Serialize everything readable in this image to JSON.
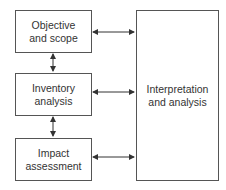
{
  "diagram": {
    "boxes": [
      {
        "id": "objective",
        "label": "Objective\nand scope"
      },
      {
        "id": "inventory",
        "label": "Inventory\nanalysis"
      },
      {
        "id": "impact",
        "label": "Impact\nassessment"
      },
      {
        "id": "interpretation",
        "label": "Interpretation\nand analysis"
      }
    ],
    "edges": [
      {
        "from": "objective",
        "to": "inventory",
        "type": "bidirectional"
      },
      {
        "from": "inventory",
        "to": "impact",
        "type": "bidirectional"
      },
      {
        "from": "objective",
        "to": "interpretation",
        "type": "bidirectional"
      },
      {
        "from": "inventory",
        "to": "interpretation",
        "type": "bidirectional"
      },
      {
        "from": "impact",
        "to": "interpretation",
        "type": "bidirectional"
      }
    ],
    "colors": {
      "stroke": "#555555",
      "text": "#333333",
      "background": "#ffffff"
    }
  }
}
